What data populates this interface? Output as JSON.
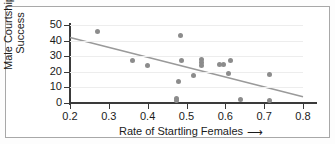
{
  "chart_data": {
    "type": "scatter",
    "title": "",
    "xlabel": "Rate of Startling Females",
    "ylabel_line1": "Male Courtship",
    "ylabel_line2": "Success",
    "xlim": [
      0.2,
      0.8
    ],
    "ylim": [
      0,
      50
    ],
    "xticks": [
      "0.2",
      "0.3",
      "0.4",
      "0.5",
      "0.6",
      "0.7",
      "0.8"
    ],
    "xtick_values": [
      0.2,
      0.3,
      0.4,
      0.5,
      0.6,
      0.7,
      0.8
    ],
    "yticks": [
      "0",
      "10",
      "20",
      "30",
      "40",
      "50"
    ],
    "ytick_values": [
      0,
      10,
      20,
      30,
      40,
      50
    ],
    "grid": "horizontal",
    "legend": "none",
    "xlabel_arrow": "⟶",
    "point_color": "#8c8c8c",
    "line_color": "#9a9a9a",
    "axis_color": "#3a3a3a",
    "grid_color": "#ededed",
    "points": [
      {
        "x": 0.27,
        "y": 46.0
      },
      {
        "x": 0.36,
        "y": 27.5
      },
      {
        "x": 0.4,
        "y": 24.0
      },
      {
        "x": 0.475,
        "y": 1.5
      },
      {
        "x": 0.475,
        "y": 3.0
      },
      {
        "x": 0.48,
        "y": 14.0
      },
      {
        "x": 0.485,
        "y": 43.5
      },
      {
        "x": 0.487,
        "y": 27.0
      },
      {
        "x": 0.518,
        "y": 17.5
      },
      {
        "x": 0.538,
        "y": 28.0
      },
      {
        "x": 0.538,
        "y": 26.0
      },
      {
        "x": 0.538,
        "y": 24.0
      },
      {
        "x": 0.585,
        "y": 24.5
      },
      {
        "x": 0.595,
        "y": 25.0
      },
      {
        "x": 0.608,
        "y": 19.0
      },
      {
        "x": 0.613,
        "y": 27.5
      },
      {
        "x": 0.64,
        "y": 2.0
      },
      {
        "x": 0.713,
        "y": 18.5
      },
      {
        "x": 0.715,
        "y": 1.5
      }
    ],
    "trend_line": {
      "x0": 0.2,
      "y0": 42.0,
      "x1": 0.8,
      "y1": 4.0
    }
  }
}
